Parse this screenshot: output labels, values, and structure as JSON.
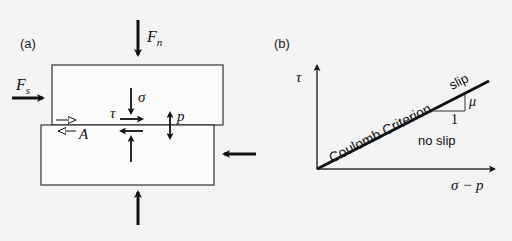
{
  "panel_a": {
    "label": "(a)",
    "forces": {
      "normal_top": "F",
      "normal_top_sub": "n",
      "shear_left": "F",
      "shear_left_sub": "s"
    },
    "stress_labels": {
      "normal_stress": "σ",
      "shear_stress": "τ",
      "pore_pressure": "p",
      "area": "A"
    }
  },
  "panel_b": {
    "label": "(b)",
    "y_axis_label": "τ",
    "x_axis_label": "σ − p",
    "line_label": "Coulomb Criterion",
    "region_above": "slip",
    "region_below": "no slip",
    "slope_run": "1",
    "slope_rise": "μ"
  },
  "colors": {
    "background": "#f4f4f4",
    "block_fill": "#fbfbfb",
    "stroke": "#111111",
    "axis": "#333333"
  }
}
